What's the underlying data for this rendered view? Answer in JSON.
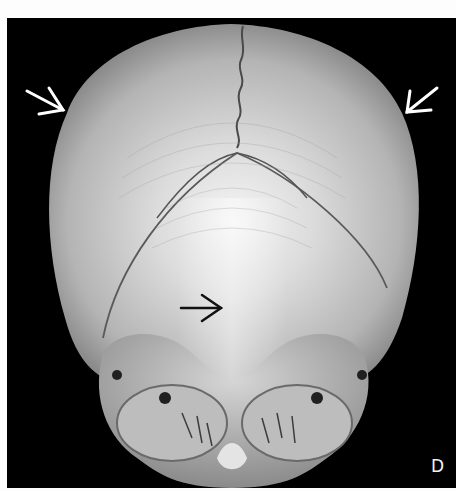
{
  "figure": {
    "panel_label": "D",
    "annotations": [
      {
        "name": "arrow-upper-left",
        "color": "#ffffff",
        "direction": "down-right"
      },
      {
        "name": "arrow-upper-right",
        "color": "#ffffff",
        "direction": "down-left"
      },
      {
        "name": "arrow-center",
        "color": "#111111",
        "direction": "right"
      }
    ],
    "colors": {
      "background": "#000000",
      "margin": "#fdfdfd",
      "bone_light": "#e8e8e8",
      "bone_mid": "#a8a8a8",
      "bone_dark": "#6e6e6e"
    }
  }
}
